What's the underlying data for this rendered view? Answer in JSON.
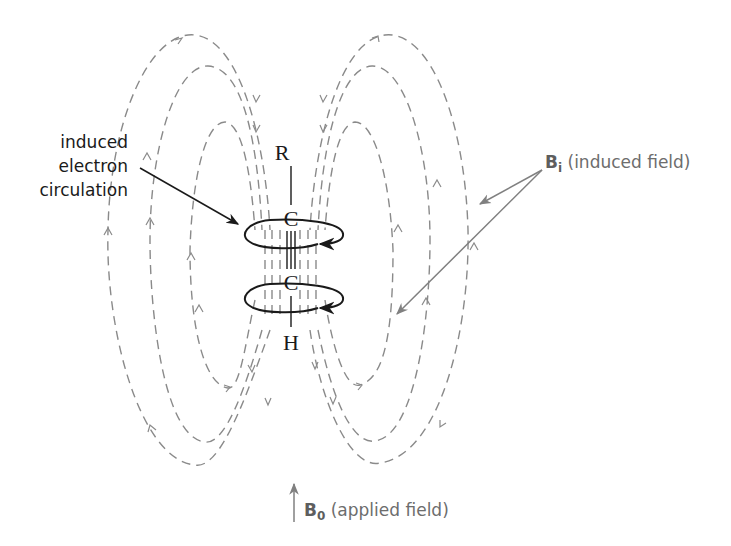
{
  "diagram": {
    "molecule": {
      "atoms": [
        "R",
        "C",
        "C",
        "H"
      ],
      "bond": "triple"
    },
    "labels": {
      "electron_circulation": [
        "induced",
        "electron",
        "circulation"
      ],
      "induced_field_symbol": "B",
      "induced_field_subscript": "i",
      "induced_field_text": " (induced field)",
      "applied_field_symbol": "B",
      "applied_field_subscript": "0",
      "applied_field_text": " (applied field)"
    },
    "colors": {
      "field_lines": "#8a8a8a",
      "molecule": "#1a1a1a",
      "induced_label": "#6d6d6d"
    },
    "field_loops_per_side": 3
  }
}
